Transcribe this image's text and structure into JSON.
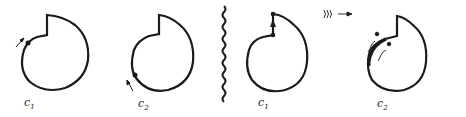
{
  "diagram": {
    "panels": [
      {
        "id": "p1",
        "label_main": "c",
        "label_sub": "1"
      },
      {
        "id": "p2",
        "label_main": "c",
        "label_sub": "2"
      },
      {
        "id": "p3",
        "label_main": "c",
        "label_sub": "1"
      },
      {
        "id": "p4",
        "label_main": "c",
        "label_sub": "2"
      }
    ],
    "divider": "wavy-line",
    "signal_icon": "sound-waves-arrow",
    "colors": {
      "stroke": "#1a1a1a",
      "background": "#ffffff"
    }
  }
}
